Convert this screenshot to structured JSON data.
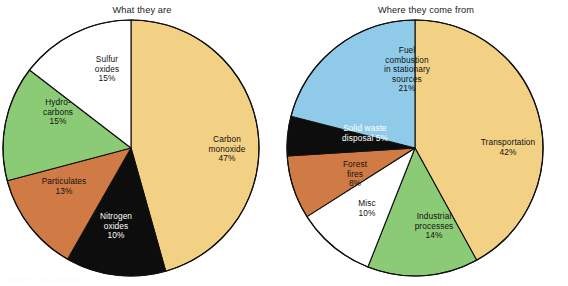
{
  "figure": {
    "background": "#ffffff",
    "ghost_caption": "Figure 1  Air pollution"
  },
  "panels": [
    {
      "title": "What they are",
      "center": {
        "x": 131,
        "y": 148
      },
      "radius": 128
    },
    {
      "title": "Where they come from",
      "center": {
        "x": 415,
        "y": 148
      },
      "radius": 128
    }
  ],
  "palette": {
    "tan": "#f2d084",
    "black": "#0d0d0d",
    "orange": "#d07b45",
    "green": "#8ccb76",
    "white": "#ffffff",
    "blue": "#8fcbe8",
    "outline": "#101010"
  },
  "chart_data": [
    {
      "type": "pie",
      "title": "What they are",
      "start_angle_deg": 0,
      "direction": "clockwise",
      "categories": [
        "Carbon monoxide",
        "Nitrogen oxides",
        "Particulates",
        "Hydrocarbons",
        "Sulfur oxides"
      ],
      "values": [
        47,
        13,
        13,
        15,
        15
      ],
      "value_unit": "%",
      "slices": [
        {
          "label": "Carbon\nmonoxide\n47%",
          "name": "Carbon monoxide",
          "value": 47,
          "value_text": "47%",
          "color": "#f2d084",
          "text_color": "dark",
          "label_x": 192,
          "label_y": 135,
          "label_w": 70
        },
        {
          "label": "Nitrogen\noxides\n10%",
          "name": "Nitrogen oxides",
          "value": 13,
          "value_text": "10%",
          "color": "#0d0d0d",
          "text_color": "light",
          "label_x": 85,
          "label_y": 212,
          "label_w": 62
        },
        {
          "label": "Particulates\n13%",
          "name": "Particulates",
          "value": 13,
          "value_text": "13%",
          "color": "#d07b45",
          "text_color": "dark",
          "label_x": 26,
          "label_y": 177,
          "label_w": 76
        },
        {
          "label": "Hydro-\ncarbons\n15%",
          "name": "Hydrocarbons",
          "value": 15,
          "value_text": "15%",
          "color": "#8ccb76",
          "text_color": "dark",
          "label_x": 27,
          "label_y": 98,
          "label_w": 62
        },
        {
          "label": "Sulfur\noxides\n15%",
          "name": "Sulfur oxides",
          "value": 15,
          "value_text": "15%",
          "color": "#ffffff",
          "text_color": "dark",
          "label_x": 78,
          "label_y": 55,
          "label_w": 58
        }
      ]
    },
    {
      "type": "pie",
      "title": "Where they come from",
      "start_angle_deg": 0,
      "direction": "clockwise",
      "categories": [
        "Transportation",
        "Industrial processes",
        "Misc",
        "Forest fires",
        "Solid waste disposal",
        "Fuel combustion in stationary sources"
      ],
      "values": [
        42,
        14,
        10,
        8,
        5,
        21
      ],
      "value_unit": "%",
      "slices": [
        {
          "label": "Transportation\n42%",
          "name": "Transportation",
          "value": 42,
          "value_text": "42%",
          "color": "#f2d084",
          "text_color": "dark",
          "label_x": 465,
          "label_y": 138,
          "label_w": 86
        },
        {
          "label": "Industrial\nprocesses\n14%",
          "name": "Industrial processes",
          "value": 14,
          "value_text": "14%",
          "color": "#8ccb76",
          "text_color": "dark",
          "label_x": 399,
          "label_y": 212,
          "label_w": 70
        },
        {
          "label": "Misc\n10%",
          "name": "Misc",
          "value": 10,
          "value_text": "10%",
          "color": "#ffffff",
          "text_color": "dark",
          "label_x": 344,
          "label_y": 199,
          "label_w": 46
        },
        {
          "label": "Forest\nfires\n8%",
          "name": "Forest fires",
          "value": 8,
          "value_text": "8%",
          "color": "#d07b45",
          "text_color": "dark",
          "label_x": 329,
          "label_y": 160,
          "label_w": 52
        },
        {
          "label": "Solid waste\ndisposal 5%",
          "name": "Solid waste disposal",
          "value": 5,
          "value_text": "5%",
          "color": "#0d0d0d",
          "text_color": "light",
          "label_x": 326,
          "label_y": 124,
          "label_w": 78
        },
        {
          "label": "Fuel\ncombustion\nin stationary\nsources\n21%",
          "name": "Fuel combustion in stationary sources",
          "value": 21,
          "value_text": "21%",
          "color": "#8fcbe8",
          "text_color": "dark",
          "label_x": 369,
          "label_y": 46,
          "label_w": 76
        }
      ]
    }
  ]
}
